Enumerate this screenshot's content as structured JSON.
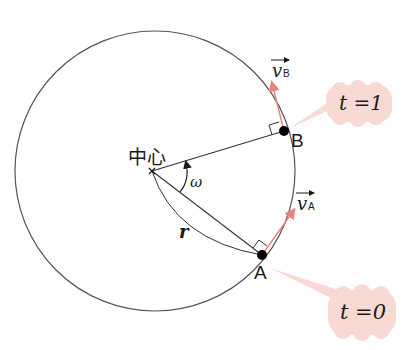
{
  "diagram": {
    "title": "",
    "center_label": "中心",
    "angular_velocity_label": "ω",
    "radius_label": "r",
    "points": [
      {
        "id": "A",
        "label": "A",
        "velocity_label": "v",
        "velocity_subscript": "A",
        "time_label": "t =0"
      },
      {
        "id": "B",
        "label": "B",
        "velocity_label": "v",
        "velocity_subscript": "B",
        "time_label": "t =1"
      }
    ],
    "colors": {
      "circle": "#555555",
      "lines": "#333333",
      "velocity_arrow": "#e8847c",
      "bubble_fill": "#f9d9d4",
      "point": "#000000"
    }
  }
}
